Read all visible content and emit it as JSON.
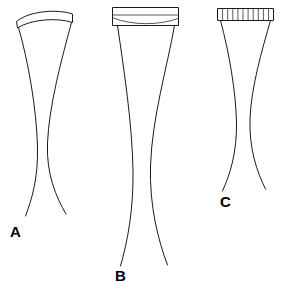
{
  "figure": {
    "background_color": "#ffffff",
    "stroke_color": "#1a1a1a",
    "width": 285,
    "height": 288,
    "panels": [
      {
        "id": "A",
        "label": "A",
        "label_x": 10,
        "label_y": 237,
        "cap_type": "curved-arc-band",
        "cap_segments": 0,
        "cap_left": 16,
        "cap_right": 73,
        "cap_top": 8,
        "cap_bottom": 23,
        "body_top": 23,
        "body_bottom": 216,
        "waist_y": 150,
        "waist_left": 36,
        "waist_right": 48,
        "bottom_left": 26,
        "bottom_right": 66
      },
      {
        "id": "B",
        "label": "B",
        "label_x": 115,
        "label_y": 281,
        "cap_type": "rectangular-band-with-arc",
        "cap_segments": 0,
        "cap_left": 112,
        "cap_right": 179,
        "cap_top": 7,
        "cap_bottom": 26,
        "body_top": 26,
        "body_bottom": 266,
        "waist_y": 175,
        "waist_left": 131,
        "waist_right": 151,
        "bottom_left": 120,
        "bottom_right": 168
      },
      {
        "id": "C",
        "label": "C",
        "label_x": 220,
        "label_y": 207,
        "cap_type": "segmented-ruler-band",
        "cap_segments": 11,
        "cap_left": 217,
        "cap_right": 273,
        "cap_top": 8,
        "cap_bottom": 21,
        "body_top": 21,
        "body_bottom": 191,
        "waist_y": 125,
        "waist_left": 235,
        "waist_right": 250,
        "bottom_left": 222,
        "bottom_right": 266
      }
    ]
  }
}
